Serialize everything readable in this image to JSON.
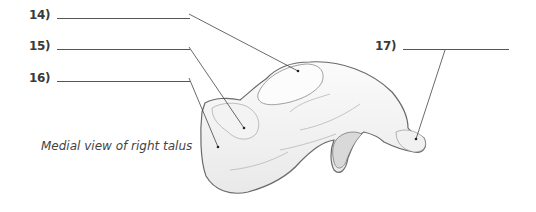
{
  "figure": {
    "caption": "Medial view of right talus",
    "labels": [
      {
        "number": "14)",
        "answer": ""
      },
      {
        "number": "15)",
        "answer": ""
      },
      {
        "number": "16)",
        "answer": ""
      },
      {
        "number": "17)",
        "answer": ""
      }
    ],
    "colors": {
      "text": "#3a3a3a",
      "line": "#555555",
      "bone_fill": "#f7f7f7",
      "bone_outline": "#6a6a6a"
    }
  }
}
